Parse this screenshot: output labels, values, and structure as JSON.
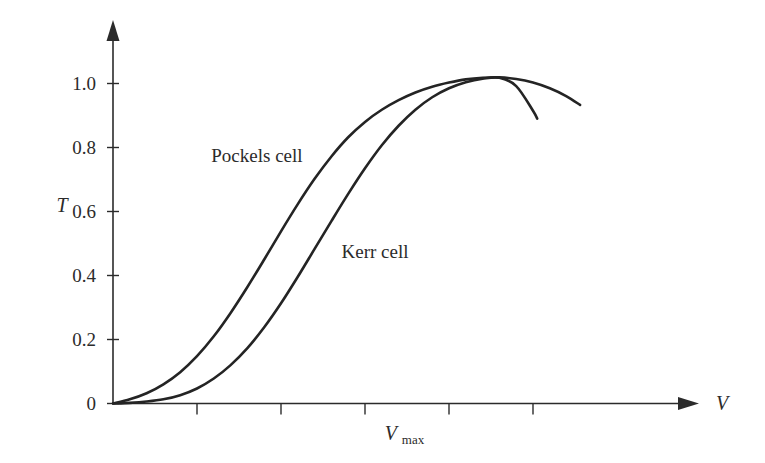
{
  "chart_data": {
    "type": "line",
    "title": "",
    "subtitle": "",
    "xlabel": "V",
    "ylabel": "T",
    "xlim": [
      0,
      6.6
    ],
    "ylim": [
      0,
      1.12
    ],
    "grid": false,
    "legend_position": "inline-annotation",
    "y_ticks": [
      "0",
      "0.2",
      "0.4",
      "0.6",
      "0.8",
      "1.0"
    ],
    "y_tick_values": [
      0,
      0.2,
      0.4,
      0.6,
      0.8,
      1.0
    ],
    "x_ticks": [
      "",
      "",
      "",
      "",
      ""
    ],
    "x_tick_values": [
      1,
      2,
      3,
      4,
      5
    ],
    "x_annotations": [
      {
        "label": "V",
        "sub": "max",
        "value": 3.45
      }
    ],
    "series": [
      {
        "name": "Pockels cell",
        "label": "Pockels cell",
        "label_x": 1.17,
        "label_y": 0.755,
        "x": [
          0.0,
          0.2,
          0.4,
          0.6,
          0.8,
          1.0,
          1.2,
          1.4,
          1.6,
          1.8,
          2.0,
          2.2,
          2.4,
          2.6,
          2.8,
          3.0,
          3.2,
          3.4,
          3.6,
          3.8,
          4.0,
          4.2,
          4.4,
          4.6,
          4.8,
          5.0,
          5.2,
          5.4,
          5.56
        ],
        "y": [
          0.0,
          0.013,
          0.032,
          0.06,
          0.098,
          0.148,
          0.21,
          0.283,
          0.364,
          0.45,
          0.538,
          0.623,
          0.702,
          0.772,
          0.832,
          0.88,
          0.918,
          0.948,
          0.972,
          0.99,
          1.003,
          1.013,
          1.018,
          1.019,
          1.014,
          1.003,
          0.985,
          0.96,
          0.933
        ]
      },
      {
        "name": "Kerr cell",
        "label": "Kerr cell",
        "label_x": 2.72,
        "label_y": 0.455,
        "x": [
          0.0,
          0.2,
          0.4,
          0.6,
          0.8,
          1.0,
          1.2,
          1.4,
          1.6,
          1.8,
          2.0,
          2.2,
          2.4,
          2.6,
          2.8,
          3.0,
          3.2,
          3.4,
          3.6,
          3.8,
          4.0,
          4.2,
          4.4,
          4.6,
          4.8,
          5.0,
          5.05
        ],
        "y": [
          0.0,
          0.002,
          0.006,
          0.013,
          0.026,
          0.047,
          0.078,
          0.12,
          0.173,
          0.238,
          0.313,
          0.396,
          0.483,
          0.57,
          0.655,
          0.735,
          0.807,
          0.868,
          0.918,
          0.957,
          0.985,
          1.004,
          1.015,
          1.018,
          0.992,
          0.915,
          0.89
        ]
      }
    ],
    "peak": {
      "x": 4.6,
      "y": 1.018
    },
    "colors": {
      "curve": "#242424",
      "axis": "#2b2b2b",
      "background": "#ffffff"
    }
  }
}
